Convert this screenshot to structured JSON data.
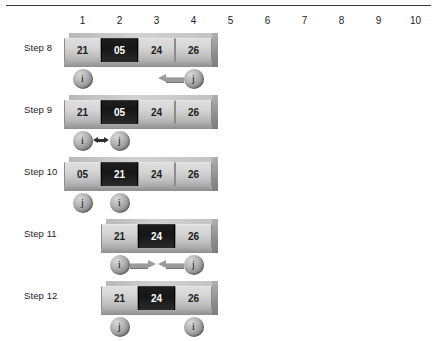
{
  "figure": {
    "has_top_rule": true,
    "column_headers": [
      "1",
      "2",
      "3",
      "4",
      "5",
      "6",
      "7",
      "8",
      "9",
      "10"
    ],
    "colors": {
      "highlight_cell": "#1a1a1a",
      "normal_cell": "#d6d6d6",
      "marker": "#a0a0a0",
      "arrow": "#9a9a9a",
      "rule": "#3a3a3a"
    },
    "steps": [
      {
        "label": "Step 8",
        "start_column": 1,
        "cells": [
          {
            "value": "21",
            "highlight": false
          },
          {
            "value": "05",
            "highlight": true
          },
          {
            "value": "24",
            "highlight": false
          },
          {
            "value": "26",
            "highlight": false
          }
        ],
        "markers": [
          {
            "name": "i",
            "column": 1,
            "arrow": "none"
          },
          {
            "name": "j",
            "column": 4,
            "arrow": "left"
          }
        ]
      },
      {
        "label": "Step 9",
        "start_column": 1,
        "cells": [
          {
            "value": "21",
            "highlight": false
          },
          {
            "value": "05",
            "highlight": true
          },
          {
            "value": "24",
            "highlight": false
          },
          {
            "value": "26",
            "highlight": false
          }
        ],
        "markers": [
          {
            "name": "i",
            "column": 1,
            "arrow": "none"
          },
          {
            "name": "j",
            "column": 2,
            "arrow": "none"
          }
        ],
        "swap_arrow": {
          "between_columns": [
            1,
            2
          ],
          "direction": "both"
        }
      },
      {
        "label": "Step 10",
        "start_column": 1,
        "cells": [
          {
            "value": "05",
            "highlight": false
          },
          {
            "value": "21",
            "highlight": true
          },
          {
            "value": "24",
            "highlight": false
          },
          {
            "value": "26",
            "highlight": false
          }
        ],
        "markers": [
          {
            "name": "j",
            "column": 1,
            "arrow": "none"
          },
          {
            "name": "i",
            "column": 2,
            "arrow": "none"
          }
        ]
      },
      {
        "label": "Step 11",
        "start_column": 2,
        "cells": [
          {
            "value": "21",
            "highlight": false
          },
          {
            "value": "24",
            "highlight": true
          },
          {
            "value": "26",
            "highlight": false
          }
        ],
        "markers": [
          {
            "name": "i",
            "column": 2,
            "arrow": "right"
          },
          {
            "name": "j",
            "column": 4,
            "arrow": "left"
          }
        ]
      },
      {
        "label": "Step 12",
        "start_column": 2,
        "cells": [
          {
            "value": "21",
            "highlight": false
          },
          {
            "value": "24",
            "highlight": true
          },
          {
            "value": "26",
            "highlight": false
          }
        ],
        "markers": [
          {
            "name": "j",
            "column": 2,
            "arrow": "none"
          },
          {
            "name": "i",
            "column": 4,
            "arrow": "none"
          }
        ]
      }
    ]
  }
}
